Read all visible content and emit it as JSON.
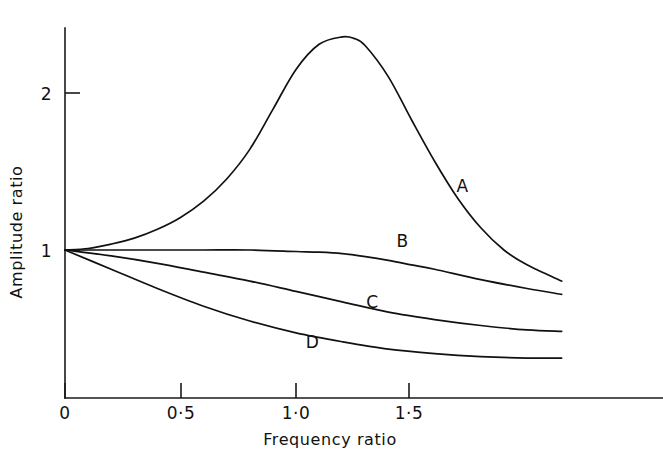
{
  "chart_data": {
    "type": "line",
    "title": "",
    "xlabel": "Frequency ratio",
    "ylabel": "Amplitude ratio",
    "xlim": [
      0,
      2.15
    ],
    "ylim": [
      0,
      2.52
    ],
    "grid": false,
    "legend_position": "inline-curve-labels",
    "xticks": [
      {
        "value": 0,
        "label": "0"
      },
      {
        "value": 0.5,
        "label": "0·5"
      },
      {
        "value": 1.0,
        "label": "1·0"
      },
      {
        "value": 1.5,
        "label": "1·5"
      }
    ],
    "yticks": [
      {
        "value": 1,
        "label": "1"
      },
      {
        "value": 2,
        "label": "2"
      }
    ],
    "series": [
      {
        "name": "A",
        "label": "A",
        "label_x": 1.72,
        "label_y": 1.39,
        "x": [
          0,
          0.1,
          0.2,
          0.3,
          0.4,
          0.5,
          0.6,
          0.7,
          0.8,
          0.9,
          1.0,
          1.1,
          1.2,
          1.25,
          1.3,
          1.4,
          1.5,
          1.6,
          1.7,
          1.8,
          1.9,
          2.0,
          2.15
        ],
        "y": [
          1.0,
          1.01,
          1.04,
          1.08,
          1.14,
          1.22,
          1.33,
          1.48,
          1.68,
          1.95,
          2.22,
          2.39,
          2.44,
          2.43,
          2.38,
          2.17,
          1.88,
          1.6,
          1.35,
          1.15,
          1.0,
          0.9,
          0.79
        ]
      },
      {
        "name": "B",
        "label": "B",
        "label_x": 1.46,
        "label_y": 1.02,
        "x": [
          0,
          0.2,
          0.4,
          0.6,
          0.8,
          1.0,
          1.1,
          1.2,
          1.3,
          1.4,
          1.5,
          1.6,
          1.8,
          2.0,
          2.15
        ],
        "y": [
          1.0,
          1.0,
          1.0,
          1.0,
          1.0,
          0.99,
          0.985,
          0.975,
          0.955,
          0.93,
          0.9,
          0.87,
          0.8,
          0.74,
          0.7
        ]
      },
      {
        "name": "C",
        "label": "C",
        "label_x": 1.33,
        "label_y": 0.61,
        "x": [
          0,
          0.2,
          0.4,
          0.6,
          0.8,
          1.0,
          1.2,
          1.4,
          1.6,
          1.8,
          2.0,
          2.15
        ],
        "y": [
          1.0,
          0.96,
          0.91,
          0.85,
          0.79,
          0.72,
          0.65,
          0.58,
          0.53,
          0.49,
          0.46,
          0.45
        ]
      },
      {
        "name": "D",
        "label": "D",
        "label_x": 1.07,
        "label_y": 0.34,
        "x": [
          0,
          0.2,
          0.4,
          0.6,
          0.8,
          1.0,
          1.2,
          1.4,
          1.6,
          1.8,
          2.0,
          2.15
        ],
        "y": [
          1.0,
          0.87,
          0.74,
          0.62,
          0.52,
          0.44,
          0.38,
          0.33,
          0.3,
          0.28,
          0.27,
          0.27
        ]
      }
    ]
  },
  "figure": {
    "background_color": "#ffffff",
    "line_color": "#111111"
  }
}
